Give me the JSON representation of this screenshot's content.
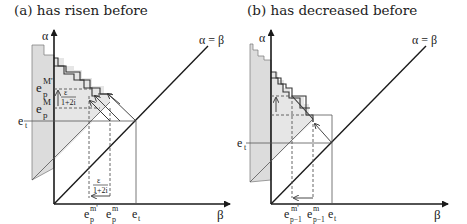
{
  "panels": [
    {
      "id": "a",
      "title": "(a) has risen before",
      "y_axis_label": "α",
      "x_axis_label": "β",
      "diagonal_label": "α = β",
      "left_labels": {
        "e_t": "e",
        "e_t_sub": "t",
        "epM_prime": "e",
        "epM_prime_sub": "p",
        "epM_prime_sup": "M'",
        "epM": "e",
        "epM_sub": "p",
        "epM_sup": "M"
      },
      "fraction_upper": {
        "num": "ε",
        "den": "1+2i"
      },
      "fraction_lower": {
        "num": "ε",
        "den": "1+2i"
      },
      "bottom_labels": [
        {
          "base": "e",
          "sub": "p",
          "sup": "m'"
        },
        {
          "base": "e",
          "sub": "p",
          "sup": "m"
        },
        {
          "base": "e",
          "sub": "t",
          "sup": ""
        }
      ]
    },
    {
      "id": "b",
      "title": "(b) has decreased before",
      "y_axis_label": "α",
      "x_axis_label": "β",
      "diagonal_label": "α = β",
      "left_labels": {
        "e_t": "e",
        "e_t_sub": "t"
      },
      "bottom_labels": [
        {
          "base": "e",
          "sub": "p−1",
          "sup": "m'"
        },
        {
          "base": "e",
          "sub": "p−1",
          "sup": "m"
        },
        {
          "base": "e",
          "sub": "t",
          "sup": ""
        }
      ]
    }
  ]
}
